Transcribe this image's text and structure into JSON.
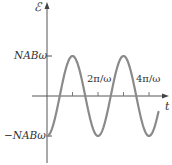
{
  "chart_data": {
    "type": "line",
    "title": "",
    "xlabel": "t",
    "ylabel": "ℰ",
    "function": "ℰ(t) = -NABω cos(ωt)",
    "x_ticks": [
      "π/ω",
      "2π/ω",
      "3π/ω",
      "4π/ω"
    ],
    "x_tick_labels_shown": [
      "2π/ω",
      "4π/ω"
    ],
    "y_ticks": [
      "NABω",
      "-NABω"
    ],
    "amplitude_label": "NABω",
    "series": [
      {
        "name": "emf",
        "x_units_of_pi_over_omega": [
          0,
          0.5,
          1,
          1.5,
          2,
          2.5,
          3,
          3.5,
          4,
          4.37
        ],
        "values_normalized": [
          -1,
          0,
          1,
          0,
          -1,
          0,
          1,
          0,
          -1,
          -0.4
        ]
      }
    ],
    "grid": false,
    "legend": null,
    "colors": {
      "curve": "#8a8a8a",
      "axis": "#555555"
    }
  },
  "labels": {
    "y_axis": "ℰ",
    "x_axis": "t",
    "y_max": "NABω",
    "y_min": "−NABω",
    "x_tick_2": "2π/ω",
    "x_tick_4": "4π/ω"
  }
}
